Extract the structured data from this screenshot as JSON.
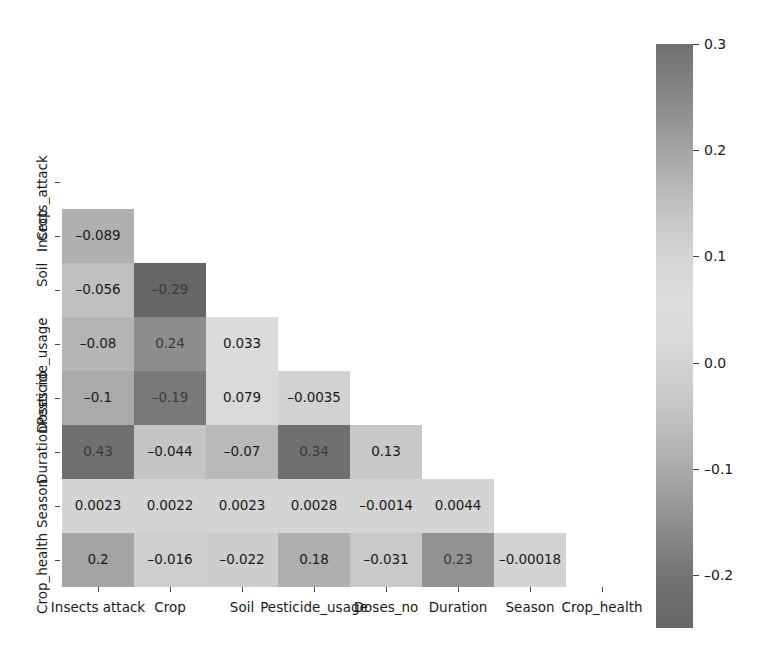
{
  "chart_data": {
    "type": "heatmap",
    "title": "",
    "xlabel": "",
    "ylabel": "",
    "grid": false,
    "triangular": "lower",
    "legend_position": "right",
    "colormap": "diverging-gray",
    "colorbar": {
      "vmin": -0.25,
      "vmax": 0.3,
      "ticks": [
        0.3,
        0.2,
        0.1,
        0.0,
        -0.1,
        -0.2
      ],
      "tick_labels": [
        "0.3",
        "0.2",
        "0.1",
        "0.0",
        "–0.1",
        "–0.2"
      ]
    },
    "x_categories": [
      "Insects attack",
      "Crop",
      "Soil",
      "Pesticide_usage",
      "Doses_no",
      "Duration",
      "Season",
      "Crop_health"
    ],
    "y_categories": [
      "Insects_attack",
      "Crop",
      "Soil",
      "Pesticide_usage",
      "Doses no",
      "Duration",
      "Season",
      "Crop_health"
    ],
    "cells": [
      {
        "row": 1,
        "col": 0,
        "value": -0.089,
        "label": "–0.089"
      },
      {
        "row": 2,
        "col": 0,
        "value": -0.056,
        "label": "–0.056"
      },
      {
        "row": 2,
        "col": 1,
        "value": -0.29,
        "label": "–0.29"
      },
      {
        "row": 3,
        "col": 0,
        "value": -0.08,
        "label": "–0.08"
      },
      {
        "row": 3,
        "col": 1,
        "value": 0.24,
        "label": "0.24"
      },
      {
        "row": 3,
        "col": 2,
        "value": 0.033,
        "label": "0.033"
      },
      {
        "row": 4,
        "col": 0,
        "value": -0.1,
        "label": "–0.1"
      },
      {
        "row": 4,
        "col": 1,
        "value": -0.19,
        "label": "–0.19"
      },
      {
        "row": 4,
        "col": 2,
        "value": 0.079,
        "label": "0.079"
      },
      {
        "row": 4,
        "col": 3,
        "value": -0.0035,
        "label": "–0.0035"
      },
      {
        "row": 5,
        "col": 0,
        "value": 0.43,
        "label": "0.43"
      },
      {
        "row": 5,
        "col": 1,
        "value": -0.044,
        "label": "–0.044"
      },
      {
        "row": 5,
        "col": 2,
        "value": -0.07,
        "label": "–0.07"
      },
      {
        "row": 5,
        "col": 3,
        "value": 0.34,
        "label": "0.34"
      },
      {
        "row": 5,
        "col": 4,
        "value": 0.13,
        "label": "0.13"
      },
      {
        "row": 6,
        "col": 0,
        "value": 0.0023,
        "label": "0.0023"
      },
      {
        "row": 6,
        "col": 1,
        "value": 0.0022,
        "label": "0.0022"
      },
      {
        "row": 6,
        "col": 2,
        "value": 0.0023,
        "label": "0.0023"
      },
      {
        "row": 6,
        "col": 3,
        "value": 0.0028,
        "label": "0.0028"
      },
      {
        "row": 6,
        "col": 4,
        "value": -0.0014,
        "label": "–0.0014"
      },
      {
        "row": 6,
        "col": 5,
        "value": 0.0044,
        "label": "0.0044"
      },
      {
        "row": 7,
        "col": 0,
        "value": 0.2,
        "label": "0.2"
      },
      {
        "row": 7,
        "col": 1,
        "value": -0.016,
        "label": "–0.016"
      },
      {
        "row": 7,
        "col": 2,
        "value": -0.022,
        "label": "–0.022"
      },
      {
        "row": 7,
        "col": 3,
        "value": 0.18,
        "label": "0.18"
      },
      {
        "row": 7,
        "col": 4,
        "value": -0.031,
        "label": "–0.031"
      },
      {
        "row": 7,
        "col": 5,
        "value": 0.23,
        "label": "0.23"
      },
      {
        "row": 7,
        "col": 6,
        "value": -0.00018,
        "label": "–0.00018"
      }
    ]
  }
}
